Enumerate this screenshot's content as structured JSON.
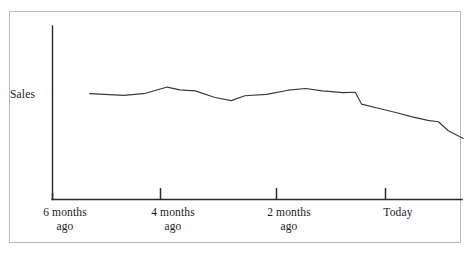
{
  "chart_data": {
    "type": "line",
    "title": "",
    "subtitle": "",
    "xlabel": "",
    "ylabel": "Sales",
    "grid": false,
    "legend": false,
    "legend_position": "none",
    "axis_style": "open-left-bottom",
    "xlim": [
      0,
      6.6
    ],
    "ylim": [
      0,
      10
    ],
    "x_unit": "months ago",
    "categories": [
      "6 months\nago",
      "4 months\nago",
      "2 months\nago",
      "Today"
    ],
    "tick_labels": [
      {
        "line1": "6 months",
        "line2": "ago",
        "x_value": 6
      },
      {
        "line1": "4 months",
        "line2": "ago",
        "x_value": 4
      },
      {
        "line1": "2 months",
        "line2": "ago",
        "x_value": 2
      },
      {
        "line1": "Today",
        "line2": "",
        "x_value": 0
      }
    ],
    "series": [
      {
        "name": "Sales",
        "color": "#3a3a3a",
        "points": [
          {
            "x": 6.0,
            "y": 6.1
          },
          {
            "x": 5.45,
            "y": 6.0
          },
          {
            "x": 5.1,
            "y": 6.12
          },
          {
            "x": 4.75,
            "y": 6.48
          },
          {
            "x": 4.55,
            "y": 6.32
          },
          {
            "x": 4.3,
            "y": 6.26
          },
          {
            "x": 3.98,
            "y": 5.88
          },
          {
            "x": 3.72,
            "y": 5.7
          },
          {
            "x": 3.5,
            "y": 5.98
          },
          {
            "x": 3.15,
            "y": 6.06
          },
          {
            "x": 2.8,
            "y": 6.3
          },
          {
            "x": 2.52,
            "y": 6.4
          },
          {
            "x": 2.25,
            "y": 6.26
          },
          {
            "x": 1.92,
            "y": 6.16
          },
          {
            "x": 1.72,
            "y": 6.18
          },
          {
            "x": 1.62,
            "y": 5.5
          },
          {
            "x": 1.35,
            "y": 5.26
          },
          {
            "x": 1.05,
            "y": 5.0
          },
          {
            "x": 0.82,
            "y": 4.78
          },
          {
            "x": 0.55,
            "y": 4.56
          },
          {
            "x": 0.38,
            "y": 4.48
          },
          {
            "x": 0.22,
            "y": 3.96
          },
          {
            "x": -0.02,
            "y": 3.52
          }
        ]
      }
    ],
    "annotations": [],
    "colors": {
      "line": "#3a3a3a",
      "axis": "#2b2b2b",
      "frame_border": "#b9b9b9",
      "text": "#1a1a1a",
      "background": "#ffffff"
    }
  }
}
